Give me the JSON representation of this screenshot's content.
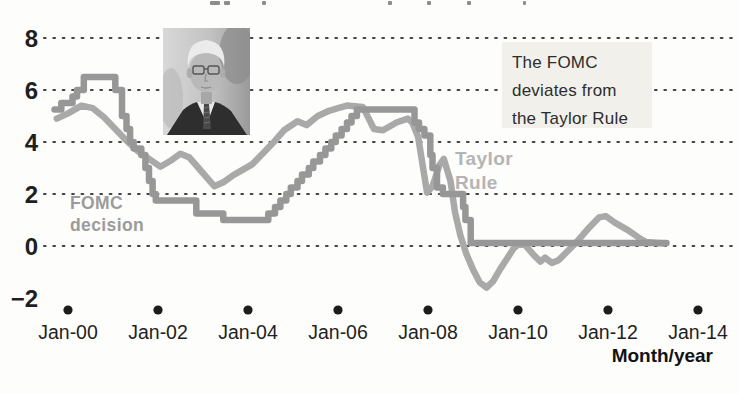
{
  "chart_data": {
    "type": "line",
    "xlabel": "Month/year",
    "ylabel": "",
    "ylim": [
      -2,
      8
    ],
    "xlim_years": [
      -0.55,
      14.85
    ],
    "grid": "dotted horizontal lines at y = 0,2,4,6,8",
    "legend_position": "inline labels on lines",
    "y_ticks": [
      {
        "label": "8",
        "value": 8,
        "gridline": true
      },
      {
        "label": "6",
        "value": 6,
        "gridline": true
      },
      {
        "label": "4",
        "value": 4,
        "gridline": true
      },
      {
        "label": "2",
        "value": 2,
        "gridline": true
      },
      {
        "label": "0",
        "value": 0,
        "gridline": true
      },
      {
        "label": "−2",
        "value": -2,
        "gridline": false
      }
    ],
    "x_ticks": [
      {
        "label": "Jan-00",
        "year": 0
      },
      {
        "label": "Jan-02",
        "year": 2
      },
      {
        "label": "Jan-04",
        "year": 4
      },
      {
        "label": "Jan-06",
        "year": 6
      },
      {
        "label": "Jan-08",
        "year": 8
      },
      {
        "label": "Jan-10",
        "year": 10
      },
      {
        "label": "Jan-12",
        "year": 12
      },
      {
        "label": "Jan-14",
        "year": 14
      }
    ],
    "series": [
      {
        "name": "Taylor Rule",
        "color": "#a9a9a9",
        "style": "linear",
        "points": [
          [
            -0.25,
            4.9
          ],
          [
            0,
            5.1
          ],
          [
            0.3,
            5.4
          ],
          [
            0.55,
            5.3
          ],
          [
            0.8,
            4.95
          ],
          [
            1.05,
            4.5
          ],
          [
            1.3,
            4.05
          ],
          [
            1.55,
            3.65
          ],
          [
            1.8,
            3.35
          ],
          [
            2.05,
            3.05
          ],
          [
            2.3,
            3.3
          ],
          [
            2.5,
            3.55
          ],
          [
            2.7,
            3.4
          ],
          [
            2.9,
            3.0
          ],
          [
            3.1,
            2.6
          ],
          [
            3.25,
            2.3
          ],
          [
            3.45,
            2.45
          ],
          [
            3.65,
            2.7
          ],
          [
            3.85,
            2.9
          ],
          [
            4.1,
            3.15
          ],
          [
            4.35,
            3.6
          ],
          [
            4.6,
            4.05
          ],
          [
            4.8,
            4.45
          ],
          [
            5.1,
            4.8
          ],
          [
            5.3,
            4.65
          ],
          [
            5.55,
            5.0
          ],
          [
            5.8,
            5.2
          ],
          [
            6.0,
            5.3
          ],
          [
            6.2,
            5.4
          ],
          [
            6.55,
            5.35
          ],
          [
            6.8,
            4.5
          ],
          [
            7.0,
            4.45
          ],
          [
            7.3,
            4.75
          ],
          [
            7.55,
            4.9
          ],
          [
            7.65,
            4.75
          ],
          [
            7.78,
            4.2
          ],
          [
            7.9,
            2.9
          ],
          [
            7.98,
            2.05
          ],
          [
            8.1,
            2.3
          ],
          [
            8.25,
            3.1
          ],
          [
            8.35,
            3.35
          ],
          [
            8.5,
            2.5
          ],
          [
            8.6,
            1.3
          ],
          [
            8.72,
            0.4
          ],
          [
            8.85,
            -0.3
          ],
          [
            9.0,
            -0.9
          ],
          [
            9.15,
            -1.4
          ],
          [
            9.3,
            -1.6
          ],
          [
            9.45,
            -1.35
          ],
          [
            9.6,
            -0.9
          ],
          [
            9.75,
            -0.5
          ],
          [
            9.9,
            -0.1
          ],
          [
            10.0,
            0.05
          ],
          [
            10.15,
            0.05
          ],
          [
            10.35,
            -0.35
          ],
          [
            10.5,
            -0.6
          ],
          [
            10.6,
            -0.45
          ],
          [
            10.75,
            -0.65
          ],
          [
            10.9,
            -0.55
          ],
          [
            11.1,
            -0.2
          ],
          [
            11.3,
            0.15
          ],
          [
            11.55,
            0.65
          ],
          [
            11.8,
            1.1
          ],
          [
            11.95,
            1.15
          ],
          [
            12.15,
            0.9
          ],
          [
            12.45,
            0.6
          ],
          [
            12.7,
            0.3
          ],
          [
            12.85,
            0.15
          ],
          [
            13.25,
            0.1
          ]
        ]
      },
      {
        "name": "FOMC decision",
        "color": "#979797",
        "style": "step",
        "points": [
          [
            -0.3,
            5.25
          ],
          [
            -0.15,
            5.5
          ],
          [
            0.1,
            5.75
          ],
          [
            0.2,
            6.0
          ],
          [
            0.35,
            6.5
          ],
          [
            1.05,
            6.0
          ],
          [
            1.2,
            5.0
          ],
          [
            1.3,
            4.5
          ],
          [
            1.38,
            4.0
          ],
          [
            1.46,
            3.75
          ],
          [
            1.63,
            3.5
          ],
          [
            1.72,
            3.0
          ],
          [
            1.8,
            2.5
          ],
          [
            1.88,
            2.0
          ],
          [
            1.95,
            1.75
          ],
          [
            2.85,
            1.25
          ],
          [
            3.45,
            1.0
          ],
          [
            4.45,
            1.25
          ],
          [
            4.6,
            1.5
          ],
          [
            4.72,
            1.75
          ],
          [
            4.85,
            2.0
          ],
          [
            4.95,
            2.25
          ],
          [
            5.1,
            2.5
          ],
          [
            5.2,
            2.75
          ],
          [
            5.35,
            3.0
          ],
          [
            5.45,
            3.25
          ],
          [
            5.6,
            3.5
          ],
          [
            5.72,
            3.75
          ],
          [
            5.85,
            4.0
          ],
          [
            5.95,
            4.25
          ],
          [
            6.08,
            4.5
          ],
          [
            6.2,
            4.75
          ],
          [
            6.3,
            5.0
          ],
          [
            6.42,
            5.25
          ],
          [
            7.7,
            4.75
          ],
          [
            7.8,
            4.5
          ],
          [
            7.92,
            4.25
          ],
          [
            8.05,
            3.5
          ],
          [
            8.1,
            3.0
          ],
          [
            8.2,
            2.25
          ],
          [
            8.33,
            2.0
          ],
          [
            8.78,
            1.5
          ],
          [
            8.83,
            1.0
          ],
          [
            8.95,
            0.12
          ],
          [
            13.3,
            0.12
          ]
        ]
      }
    ],
    "annotation_box": "The FOMC deviates from the Taylor Rule"
  },
  "callout": {
    "lines": [
      "The FOMC",
      "deviates from",
      "the Taylor Rule"
    ],
    "bg": "#f1f0ea"
  },
  "labels": {
    "fomc": {
      "line1": "FOMC",
      "line2": "decision",
      "color": "#9b9b9b"
    },
    "taylor": {
      "line1": "Taylor",
      "line2": "Rule",
      "color": "#b4b4b4"
    },
    "axis_title": "Month/year"
  },
  "colors": {
    "fomc_line": "#979797",
    "taylor_line": "#a9a9a9",
    "gridline_dots": "#454545",
    "tick_dots": "#1c1c1c",
    "axis_text": "#1f1f1f"
  },
  "portrait": {
    "description": "grayscale photo of a white-haired man wearing glasses and a dark suit"
  }
}
